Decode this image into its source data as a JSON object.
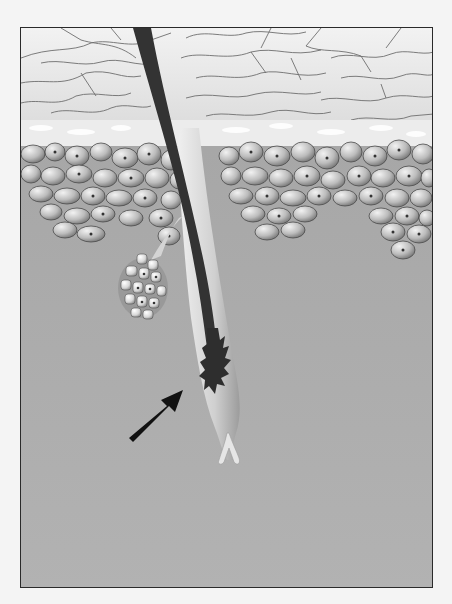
{
  "figure": {
    "layers": [
      "stratum-corneum",
      "granular-layer",
      "epidermal-cell-layer",
      "dermis"
    ],
    "structures": [
      "hair-shaft",
      "sebaceous-gland",
      "hair-bulb",
      "dermal-papilla"
    ],
    "annotation": {
      "type": "arrow",
      "points_to": "hair-bulb",
      "direction": "up-right"
    },
    "colors": {
      "page_background": "#f4f4f4",
      "frame_border": "#2a2a2a",
      "stratum_corneum": "#e6e6e6",
      "corneum_lines": "#6e6e6e",
      "granular_layer": "#f0f0f0",
      "cell_fill": "#bdbdbd",
      "cell_outline": "#4a4a4a",
      "dermis": "#a9a9a9",
      "hair_shaft": "#333333",
      "follicle_sheath": "#d6d6d6",
      "arrow": "#111111"
    }
  }
}
